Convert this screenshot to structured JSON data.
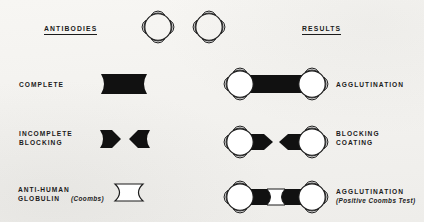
{
  "diagram": {
    "background_color": "#f4f3f0",
    "ink_color": "#1b1b1b",
    "columns": {
      "antibodies_header": "ANTIBODIES",
      "results_header": "RESULTS"
    },
    "top_cells": {
      "count": 2,
      "caption": "",
      "cell_name": "red-blood-cell"
    },
    "rows": [
      {
        "id": "complete",
        "antibody_label": "COMPLETE",
        "antibody_shape": "solid-spool",
        "result_label": "AGGLUTINATION",
        "result_sublabel": "",
        "result_shape": "two-cells-bridged"
      },
      {
        "id": "incomplete-blocking",
        "antibody_label": "INCOMPLETE\nBLOCKING",
        "antibody_shape": "two-half-spools",
        "result_label": "BLOCKING\nCOATING",
        "result_sublabel": "",
        "result_shape": "two-cells-coated-unbridged"
      },
      {
        "id": "anti-human-globulin",
        "antibody_label": "ANTI-HUMAN\nGLOBULIN",
        "antibody_label_italic": "(Coombs)",
        "antibody_shape": "hollow-spool",
        "result_label": "AGGLUTINATION",
        "result_sublabel": "(Positive Coombs Test)",
        "result_shape": "two-cells-bridged-via-coombs"
      }
    ]
  }
}
